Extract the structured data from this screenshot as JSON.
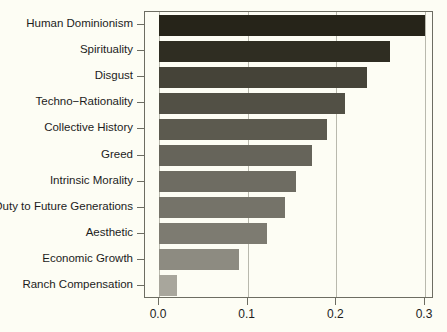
{
  "chart_data": {
    "type": "bar",
    "orientation": "horizontal",
    "title": "",
    "subtitle": "",
    "xlabel": "",
    "ylabel": "",
    "xlim": [
      0.0,
      0.3
    ],
    "grid": true,
    "legend": null,
    "x_ticks": [
      "0.0",
      "0.1",
      "0.2",
      "0.3"
    ],
    "x_tick_values": [
      0.0,
      0.1,
      0.2,
      0.3
    ],
    "categories": [
      "Human Dominionism",
      "Spirituality",
      "Disgust",
      "Techno−Rationality",
      "Collective History",
      "Greed",
      "Intrinsic Morality",
      "Duty to Future Generations",
      "Aesthetic",
      "Economic Growth",
      "Ranch Compensation"
    ],
    "values": [
      0.3,
      0.26,
      0.235,
      0.21,
      0.19,
      0.173,
      0.155,
      0.142,
      0.122,
      0.09,
      0.02
    ],
    "bar_colors": [
      "#262419",
      "#2f2d22",
      "#454338",
      "#525045",
      "#5c5a4f",
      "#66645a",
      "#6e6c62",
      "#757369",
      "#7d7b71",
      "#8d8b81",
      "#a8a69c"
    ]
  },
  "style": {
    "background": "#fdfdf4",
    "panel_background": "#fdfdf4",
    "panel_border": "#6d6d62",
    "gridline_color": "#b9b9ad",
    "tick_color": "#6d6d62",
    "text_color": "#1c1c1c"
  }
}
